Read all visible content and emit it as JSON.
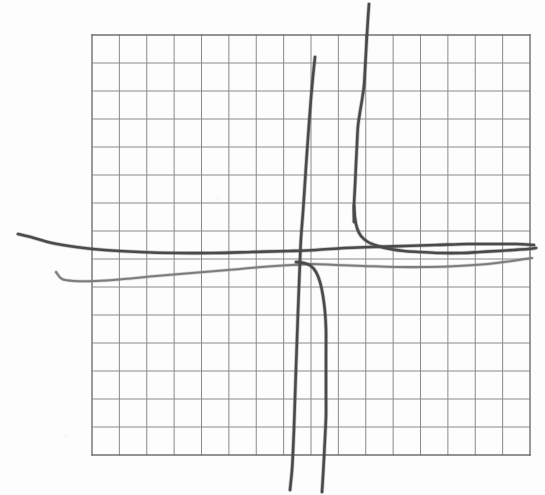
{
  "figure": {
    "kind": "hand-drawn-graph-on-grid-paper",
    "background_color": "#fdfdfd",
    "ink_color": "#4a4a4a",
    "ink_color_light": "#7d7d7d",
    "grid_color": "#8a8a8a"
  },
  "chart_data": {
    "type": "line",
    "title": "",
    "subtitle": "",
    "xlabel": "",
    "ylabel": "",
    "grid": true,
    "legend_position": "none",
    "annotations": [],
    "tick_labels": {
      "x": [],
      "y": []
    },
    "grid_geometry": {
      "left": 92,
      "top": 35,
      "right": 530,
      "bottom": 455,
      "columns": 16,
      "rows": 15,
      "cell_width": 27.4,
      "cell_height": 28.0,
      "border_color": "#6f6f6f",
      "line_color": "#8a8a8a",
      "line_width": 1.0,
      "border_width": 1.4
    },
    "axis_ranges": {
      "xlim": [
        92,
        530
      ],
      "ylim": [
        35,
        455
      ]
    },
    "series": [
      {
        "name": "branch-upper-left-horizontal",
        "role": "left hyperbola branch, upper horizontal arm",
        "color": "#4a4a4a",
        "width": 2.6,
        "points": [
          [
            18,
            234
          ],
          [
            34,
            238
          ],
          [
            52,
            243
          ],
          [
            76,
            247
          ],
          [
            104,
            250
          ],
          [
            140,
            252
          ],
          [
            176,
            253
          ],
          [
            214,
            253
          ],
          [
            252,
            252
          ],
          [
            290,
            251
          ],
          [
            316,
            250
          ],
          [
            344,
            248
          ],
          [
            372,
            247
          ],
          [
            404,
            246
          ],
          [
            436,
            245
          ],
          [
            468,
            244
          ],
          [
            496,
            244
          ],
          [
            516,
            244
          ],
          [
            534,
            245
          ]
        ]
      },
      {
        "name": "branch-lower-left-horizontal",
        "role": "second hyperbola branch, lighter horizontal arm",
        "color": "#7d7d7d",
        "width": 2.1,
        "points": [
          [
            56,
            272
          ],
          [
            62,
            279
          ],
          [
            74,
            281
          ],
          [
            96,
            281
          ],
          [
            124,
            279
          ],
          [
            156,
            276
          ],
          [
            192,
            273
          ],
          [
            228,
            270
          ],
          [
            262,
            267
          ],
          [
            292,
            265
          ],
          [
            312,
            264
          ],
          [
            336,
            265
          ],
          [
            364,
            266
          ],
          [
            396,
            267
          ],
          [
            428,
            267
          ],
          [
            458,
            266
          ],
          [
            488,
            264
          ],
          [
            512,
            261
          ],
          [
            532,
            258
          ]
        ]
      },
      {
        "name": "branch-center-vertical",
        "role": "steep near-vertical asymptotic branch through center",
        "color": "#4a4a4a",
        "width": 2.6,
        "points": [
          [
            315,
            57
          ],
          [
            313,
            76
          ],
          [
            311,
            98
          ],
          [
            309,
            124
          ],
          [
            307,
            152
          ],
          [
            305,
            182
          ],
          [
            303,
            212
          ],
          [
            301,
            238
          ],
          [
            300,
            260
          ],
          [
            299,
            286
          ],
          [
            298,
            312
          ],
          [
            297,
            340
          ],
          [
            296,
            368
          ],
          [
            295,
            398
          ],
          [
            294,
            428
          ],
          [
            293,
            452
          ],
          [
            292,
            470
          ],
          [
            290,
            490
          ]
        ]
      },
      {
        "name": "branch-right-vertical-descending",
        "role": "right hyperbola branch, vertical arm from top",
        "color": "#4a4a4a",
        "width": 2.6,
        "points": [
          [
            369,
            4
          ],
          [
            368,
            18
          ],
          [
            367,
            34
          ],
          [
            366,
            52
          ],
          [
            365,
            70
          ],
          [
            364,
            86
          ],
          [
            362,
            100
          ],
          [
            360,
            112
          ],
          [
            358,
            126
          ],
          [
            357,
            144
          ],
          [
            356,
            164
          ],
          [
            355,
            186
          ],
          [
            354,
            206
          ],
          [
            354,
            222
          ]
        ]
      },
      {
        "name": "branch-right-corner-to-horizontal",
        "role": "right hyperbola branch, corner sweeping into horizontal asymptote",
        "color": "#4a4a4a",
        "width": 2.6,
        "points": [
          [
            354,
            206
          ],
          [
            355,
            218
          ],
          [
            357,
            228
          ],
          [
            361,
            236
          ],
          [
            368,
            242
          ],
          [
            378,
            246
          ],
          [
            390,
            249
          ],
          [
            404,
            251
          ],
          [
            420,
            252
          ],
          [
            440,
            253
          ],
          [
            462,
            253
          ],
          [
            480,
            252
          ],
          [
            498,
            251
          ],
          [
            514,
            250
          ],
          [
            528,
            249
          ],
          [
            536,
            248
          ]
        ]
      },
      {
        "name": "branch-lower-vertical-descending",
        "role": "second steep branch dropping below horizontal asymptote",
        "color": "#4a4a4a",
        "width": 2.6,
        "points": [
          [
            296,
            262
          ],
          [
            304,
            263
          ],
          [
            311,
            266
          ],
          [
            316,
            272
          ],
          [
            320,
            282
          ],
          [
            323,
            296
          ],
          [
            325,
            312
          ],
          [
            326,
            330
          ],
          [
            326,
            350
          ],
          [
            326,
            372
          ],
          [
            326,
            394
          ],
          [
            326,
            416
          ],
          [
            325,
            438
          ],
          [
            324,
            458
          ],
          [
            323,
            476
          ],
          [
            322,
            492
          ]
        ]
      }
    ]
  }
}
